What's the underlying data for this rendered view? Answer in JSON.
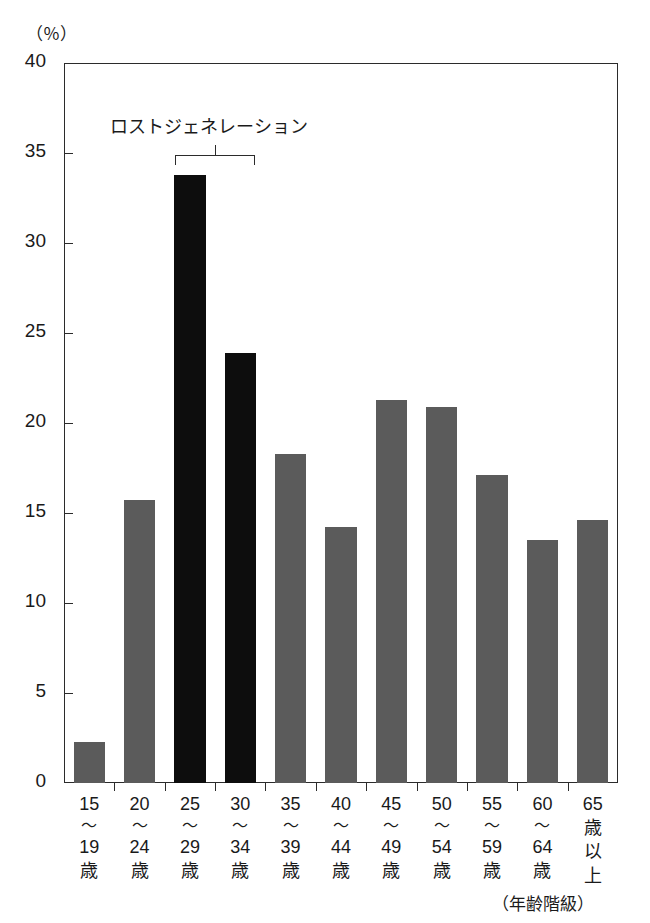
{
  "chart_data": {
    "type": "bar",
    "title": "",
    "xlabel": "（年齢階級）",
    "ylabel": "（％）",
    "ylim": [
      0,
      40
    ],
    "ytick_step": 5,
    "yticks": [
      40,
      35,
      30,
      25,
      20,
      15,
      10,
      5,
      0
    ],
    "grid": false,
    "legend": false,
    "categories": [
      "15〜19歳",
      "20〜24歳",
      "25〜29歳",
      "30〜34歳",
      "35〜39歳",
      "40〜44歳",
      "45〜49歳",
      "50〜54歳",
      "55〜59歳",
      "60〜64歳",
      "65歳以上"
    ],
    "category_lines": [
      [
        "15",
        "〜",
        "19",
        "歳"
      ],
      [
        "20",
        "〜",
        "24",
        "歳"
      ],
      [
        "25",
        "〜",
        "29",
        "歳"
      ],
      [
        "30",
        "〜",
        "34",
        "歳"
      ],
      [
        "35",
        "〜",
        "39",
        "歳"
      ],
      [
        "40",
        "〜",
        "44",
        "歳"
      ],
      [
        "45",
        "〜",
        "49",
        "歳"
      ],
      [
        "50",
        "〜",
        "54",
        "歳"
      ],
      [
        "55",
        "〜",
        "59",
        "歳"
      ],
      [
        "60",
        "〜",
        "64",
        "歳"
      ],
      [
        "65",
        "歳",
        "以",
        "上"
      ]
    ],
    "values": [
      2.3,
      15.7,
      33.8,
      23.9,
      18.3,
      14.2,
      21.3,
      20.9,
      17.1,
      13.5,
      14.6
    ],
    "bar_colors": [
      "#5b5b5b",
      "#5b5b5b",
      "#0d0d0d",
      "#0d0d0d",
      "#5b5b5b",
      "#5b5b5b",
      "#5b5b5b",
      "#5b5b5b",
      "#5b5b5b",
      "#5b5b5b",
      "#5b5b5b"
    ],
    "annotations": [
      {
        "text": "ロストジェネレーション",
        "covers_categories": [
          "25〜29歳",
          "30〜34歳"
        ],
        "type": "bracket"
      }
    ],
    "colors": {
      "highlight": "#0d0d0d",
      "normal": "#5b5b5b",
      "axis": "#2b2b2b",
      "background": "#ffffff"
    }
  },
  "axis": {
    "unit_label": "（％）",
    "x_caption": "（年齢階級）"
  },
  "annotation": {
    "label": "ロストジェネレーション"
  }
}
